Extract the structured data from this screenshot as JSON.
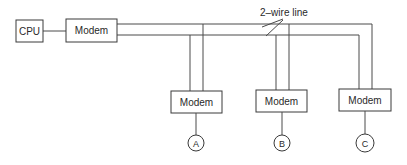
{
  "diagram": {
    "type": "multipoint-line-network",
    "wire_label": "2–wire line",
    "nodes": {
      "cpu": {
        "label": "CPU"
      },
      "main_modem": {
        "label": "Modem"
      },
      "modem_a": {
        "label": "Modem"
      },
      "modem_b": {
        "label": "Modem"
      },
      "modem_c": {
        "label": "Modem"
      },
      "terminal_a": {
        "label": "A"
      },
      "terminal_b": {
        "label": "B"
      },
      "terminal_c": {
        "label": "C"
      }
    },
    "edges": [
      {
        "from": "cpu",
        "to": "main_modem"
      },
      {
        "from": "main_modem",
        "to": "modem_a",
        "via": "2–wire line"
      },
      {
        "from": "main_modem",
        "to": "modem_b",
        "via": "2–wire line"
      },
      {
        "from": "main_modem",
        "to": "modem_c",
        "via": "2–wire line"
      },
      {
        "from": "modem_a",
        "to": "terminal_a"
      },
      {
        "from": "modem_b",
        "to": "terminal_b"
      },
      {
        "from": "modem_c",
        "to": "terminal_c"
      }
    ]
  }
}
